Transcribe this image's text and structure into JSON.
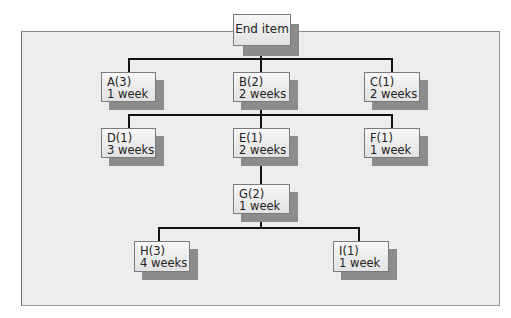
{
  "diagram": {
    "type": "product-structure-tree",
    "root": {
      "label": "End item"
    },
    "nodes": [
      {
        "id": "A",
        "title": "A(3)",
        "lead_time": "1 week",
        "parent": "End item"
      },
      {
        "id": "B",
        "title": "B(2)",
        "lead_time": "2 weeks",
        "parent": "End item"
      },
      {
        "id": "C",
        "title": "C(1)",
        "lead_time": "2 weeks",
        "parent": "End item"
      },
      {
        "id": "D",
        "title": "D(1)",
        "lead_time": "3 weeks",
        "parent": "B"
      },
      {
        "id": "E",
        "title": "E(1)",
        "lead_time": "2 weeks",
        "parent": "B"
      },
      {
        "id": "F",
        "title": "F(1)",
        "lead_time": "1 week",
        "parent": "B"
      },
      {
        "id": "G",
        "title": "G(2)",
        "lead_time": "1 week",
        "parent": "E"
      },
      {
        "id": "H",
        "title": "H(3)",
        "lead_time": "4 weeks",
        "parent": "G"
      },
      {
        "id": "I",
        "title": "I(1)",
        "lead_time": "1 week",
        "parent": "G"
      }
    ],
    "colors": {
      "panel": "#ededed",
      "box": "#e8e8e8",
      "shadow": "#8c8c8c",
      "connector": "#111111"
    }
  }
}
